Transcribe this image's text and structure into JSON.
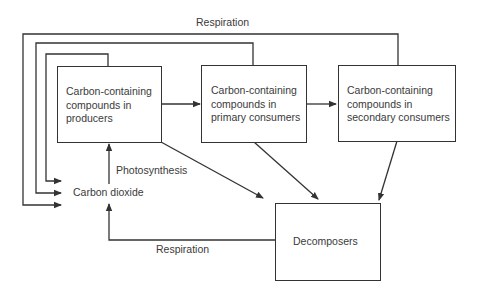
{
  "diagram": {
    "type": "flowchart",
    "nodes": {
      "producers": {
        "lines": [
          "Carbon-containing",
          "compounds in",
          "producers"
        ]
      },
      "primary": {
        "lines": [
          "Carbon-containing",
          "compounds in",
          "primary consumers"
        ]
      },
      "secondary": {
        "lines": [
          "Carbon-containing",
          "compounds in",
          "secondary consumers"
        ]
      },
      "decomposers": {
        "label": "Decomposers"
      },
      "co2": {
        "label": "Carbon dioxide"
      }
    },
    "edge_labels": {
      "respiration_top": "Respiration",
      "respiration_bottom": "Respiration",
      "photosynthesis": "Photosynthesis"
    },
    "edges": [
      {
        "from": "producers",
        "to": "primary"
      },
      {
        "from": "primary",
        "to": "secondary"
      },
      {
        "from": "co2",
        "to": "producers",
        "label": "Photosynthesis"
      },
      {
        "from": "producers",
        "to": "co2",
        "label": "Respiration"
      },
      {
        "from": "primary",
        "to": "co2",
        "label": "Respiration"
      },
      {
        "from": "secondary",
        "to": "co2",
        "label": "Respiration"
      },
      {
        "from": "producers",
        "to": "decomposers"
      },
      {
        "from": "primary",
        "to": "decomposers"
      },
      {
        "from": "secondary",
        "to": "decomposers"
      },
      {
        "from": "decomposers",
        "to": "co2",
        "label": "Respiration"
      }
    ],
    "colors": {
      "line": "#333333",
      "text": "#3a3a3a",
      "background": "#ffffff"
    }
  }
}
